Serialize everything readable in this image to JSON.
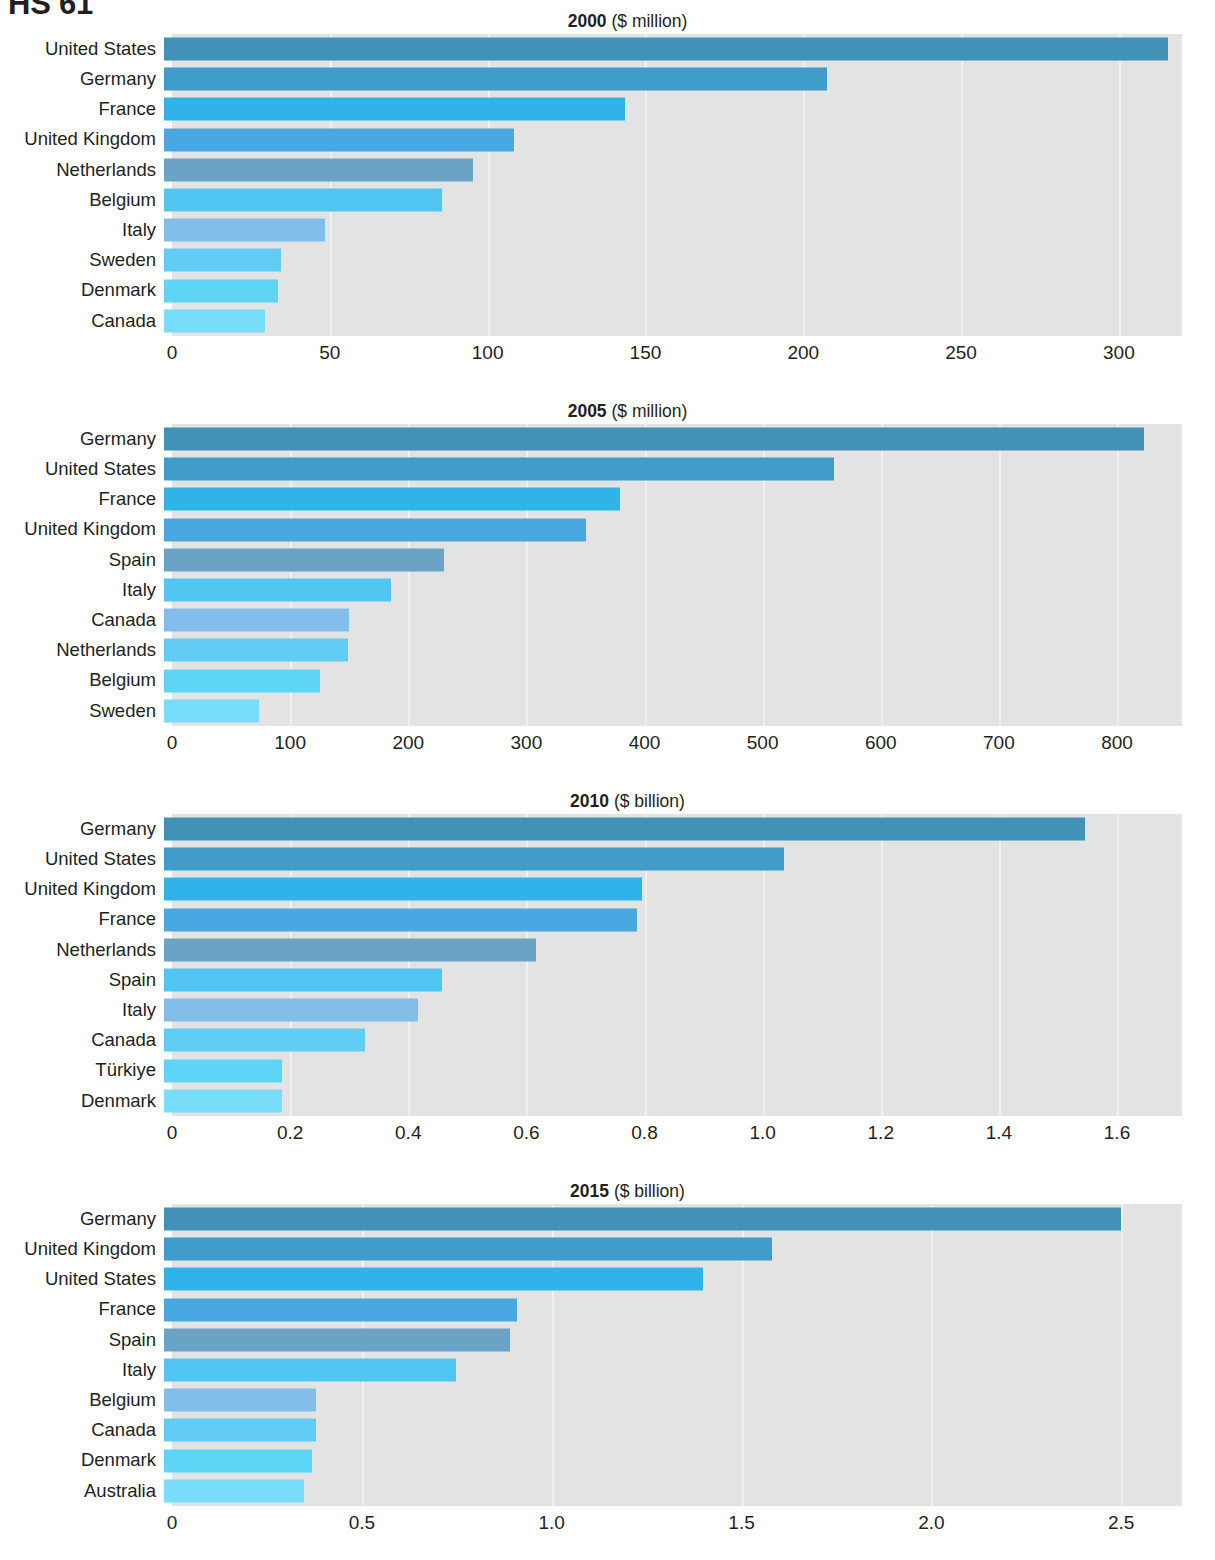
{
  "page": {
    "title": "HS 61"
  },
  "colors": {
    "plot_background": "#e3e3e3",
    "gridline": "#f2f2f2",
    "text": "#231f20",
    "palette": {
      "dark_steel": "#4292b8",
      "steel": "#4f9fca",
      "muted_steel": "#6ba3c4",
      "bright": "#35b4e8",
      "mid": "#4aa8e0",
      "light_mid": "#6fb5e6",
      "sky": "#5ec8f0",
      "pale_sky": "#74d3f5",
      "pale": "#7fd3f4",
      "palest": "#8ddcf8"
    }
  },
  "chart_data": [
    {
      "type": "bar",
      "orientation": "horizontal",
      "title": "2000",
      "unit": "($ million)",
      "xlabel": "",
      "ylabel": "",
      "xlim": [
        0,
        320
      ],
      "grid": true,
      "ticks": [
        0,
        50,
        100,
        150,
        200,
        250,
        300
      ],
      "tick_labels": [
        "0",
        "50",
        "100",
        "150",
        "200",
        "250",
        "300"
      ],
      "categories": [
        "United States",
        "Germany",
        "France",
        "United Kingdom",
        "Netherlands",
        "Belgium",
        "Italy",
        "Sweden",
        "Denmark",
        "Canada"
      ],
      "values": [
        318,
        210,
        146,
        111,
        98,
        88,
        51,
        37,
        36,
        32
      ],
      "bar_colors": [
        "#4292b8",
        "#3f9ccb",
        "#2fb3e9",
        "#49a8e2",
        "#6ba3c4",
        "#52c6f2",
        "#83bdea",
        "#62cdf4",
        "#5ed4f7",
        "#77dcf9"
      ]
    },
    {
      "type": "bar",
      "orientation": "horizontal",
      "title": "2005",
      "unit": "($ million)",
      "xlabel": "",
      "ylabel": "",
      "xlim": [
        0,
        855
      ],
      "grid": true,
      "ticks": [
        0,
        100,
        200,
        300,
        400,
        500,
        600,
        700,
        800
      ],
      "tick_labels": [
        "0",
        "100",
        "200",
        "300",
        "400",
        "500",
        "600",
        "700",
        "800"
      ],
      "categories": [
        "Germany",
        "United States",
        "France",
        "United Kingdom",
        "Spain",
        "Italy",
        "Canada",
        "Netherlands",
        "Belgium",
        "Sweden"
      ],
      "values": [
        830,
        567,
        386,
        357,
        237,
        192,
        157,
        156,
        132,
        80
      ],
      "bar_colors": [
        "#4292b8",
        "#3f9ccb",
        "#2fb3e9",
        "#49a8e2",
        "#6ba3c4",
        "#52c6f2",
        "#83bdea",
        "#62cdf4",
        "#5ed4f7",
        "#77dcf9"
      ]
    },
    {
      "type": "bar",
      "orientation": "horizontal",
      "title": "2010",
      "unit": "($ billion)",
      "xlabel": "",
      "ylabel": "",
      "xlim": [
        0,
        1.71
      ],
      "grid": true,
      "ticks": [
        0,
        0.2,
        0.4,
        0.6,
        0.8,
        1.0,
        1.2,
        1.4,
        1.6
      ],
      "tick_labels": [
        "0",
        "0.2",
        "0.4",
        "0.6",
        "0.8",
        "1.0",
        "1.2",
        "1.4",
        "1.6"
      ],
      "categories": [
        "Germany",
        "United States",
        "United Kingdom",
        "France",
        "Netherlands",
        "Spain",
        "Italy",
        "Canada",
        "Türkiye",
        "Denmark"
      ],
      "values": [
        1.56,
        1.05,
        0.81,
        0.8,
        0.63,
        0.47,
        0.43,
        0.34,
        0.2,
        0.2
      ],
      "bar_colors": [
        "#4292b8",
        "#3f9ccb",
        "#2fb3e9",
        "#49a8e2",
        "#6ba3c4",
        "#52c6f2",
        "#83bdea",
        "#62cdf4",
        "#5ed4f7",
        "#77dcf9"
      ]
    },
    {
      "type": "bar",
      "orientation": "horizontal",
      "title": "2015",
      "unit": "($ billion)",
      "xlabel": "",
      "ylabel": "",
      "xlim": [
        0,
        2.66
      ],
      "grid": true,
      "ticks": [
        0,
        0.5,
        1.0,
        1.5,
        2.0,
        2.5
      ],
      "tick_labels": [
        "0",
        "0.5",
        "1.0",
        "1.5",
        "2.0",
        "2.5"
      ],
      "categories": [
        "Germany",
        "United Kingdom",
        "United States",
        "France",
        "Spain",
        "Italy",
        "Belgium",
        "Canada",
        "Denmark",
        "Australia"
      ],
      "values": [
        2.52,
        1.6,
        1.42,
        0.93,
        0.91,
        0.77,
        0.4,
        0.4,
        0.39,
        0.37
      ],
      "bar_colors": [
        "#4292b8",
        "#3f9ccb",
        "#2fb3e9",
        "#49a8e2",
        "#6ba3c4",
        "#52c6f2",
        "#83bdea",
        "#62cdf4",
        "#5ed4f7",
        "#77dcf9"
      ]
    }
  ]
}
